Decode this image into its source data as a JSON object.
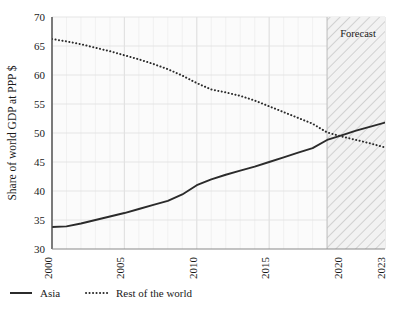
{
  "chart_data": {
    "type": "line",
    "title": "",
    "xlabel": "",
    "ylabel": "Share of world GDP at PPP $",
    "xlim": [
      2000,
      2023
    ],
    "ylim": [
      30,
      70
    ],
    "yticks": [
      30,
      35,
      40,
      45,
      50,
      55,
      60,
      65,
      70
    ],
    "ytick_labels": [
      "30",
      "35",
      "40",
      "45",
      "50",
      "55",
      "60",
      "65",
      "70"
    ],
    "xticks": [
      2000,
      2005,
      2010,
      2015,
      2020,
      2023
    ],
    "xtick_labels": [
      "2000",
      "2005",
      "2010",
      "2015",
      "2020",
      "2023"
    ],
    "grid": true,
    "legend_position": "below-left",
    "x": [
      2000,
      2001,
      2002,
      2003,
      2004,
      2005,
      2006,
      2007,
      2008,
      2009,
      2010,
      2011,
      2012,
      2013,
      2014,
      2015,
      2016,
      2017,
      2018,
      2019,
      2020,
      2021,
      2022,
      2023
    ],
    "series": [
      {
        "name": "Asia",
        "style": "solid",
        "color": "#2b2b2b",
        "values": [
          33.8,
          33.9,
          34.4,
          35.0,
          35.6,
          36.2,
          36.9,
          37.6,
          38.3,
          39.4,
          41.0,
          42.0,
          42.8,
          43.5,
          44.2,
          45.0,
          45.8,
          46.6,
          47.4,
          48.8,
          49.6,
          50.4,
          51.1,
          51.8
        ]
      },
      {
        "name": "Rest of the world",
        "style": "dotted",
        "color": "#2b2b2b",
        "values": [
          66.2,
          65.8,
          65.3,
          64.7,
          64.1,
          63.4,
          62.7,
          61.9,
          61.0,
          59.9,
          58.6,
          57.5,
          57.0,
          56.4,
          55.6,
          54.6,
          53.6,
          52.6,
          51.6,
          50.1,
          49.4,
          48.8,
          48.2,
          47.5
        ]
      }
    ],
    "annotations": [
      {
        "name": "forecast-band",
        "label": "Forecast",
        "type": "shaded-hatched-region",
        "x_start": 2019,
        "x_end": 2023
      }
    ]
  },
  "legend": {
    "items": [
      {
        "label": "Asia",
        "marker": "solid-line-swatch"
      },
      {
        "label": "Rest of the world",
        "marker": "dotted-line-swatch"
      }
    ]
  }
}
